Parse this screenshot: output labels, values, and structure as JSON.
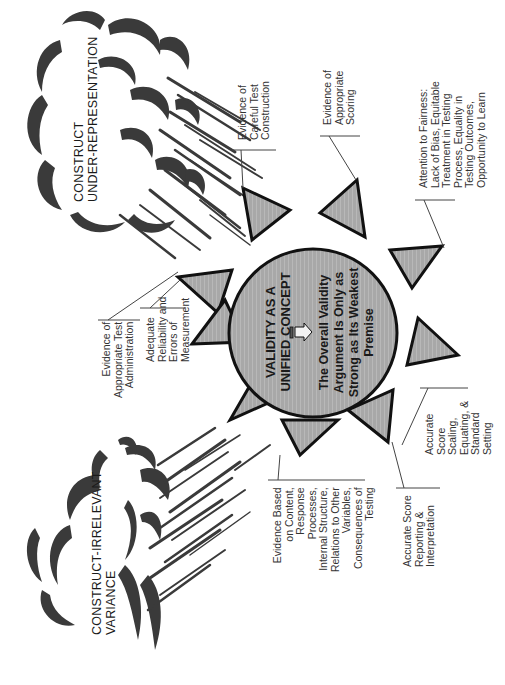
{
  "diagram": {
    "orientation": "rotated 90 degrees counter-clockwise",
    "center": {
      "title": "VALIDITY AS A\nUNIFIED CONCEPT",
      "arrow_icon": "right-arrow",
      "message": "The Overall Validity\nArgument Is Only as\nStrong as Its Weakest\nPremise"
    },
    "threats": [
      {
        "id": "construct-under-representation",
        "label": "CONSTRUCT\nUNDER-REPRESENTATION"
      },
      {
        "id": "construct-irrelevant-variance",
        "label": "CONSTRUCT-IRRELEVANT\nVARIANCE"
      }
    ],
    "premises": [
      {
        "id": "fairness",
        "label": "Attention to Fairness:\nLack of Bias, Equitable\nTreatment in Testing\nProcess, Equality in\nTesting Outcomes,\nOpportunity to Learn"
      },
      {
        "id": "scoring",
        "label": "Evidence of\nAppropriate\nScoring"
      },
      {
        "id": "test-construction",
        "label": "Evidence of\nCareful Test\nConstruction"
      },
      {
        "id": "reliability",
        "label": "Adequate\nReliability and\nErrors of\nMeasurement"
      },
      {
        "id": "test-administration",
        "label": "Evidence of\nAppropriate Test\nAdministration"
      },
      {
        "id": "content-evidence",
        "label": "Evidence Based\non Content,\nResponse\nProcesses,\nInternal Structure,\nRelations to Other\nVariables,\nConsequences of\nTesting"
      },
      {
        "id": "score-reporting",
        "label": "Accurate Score\nReporting &\nInterpretation"
      },
      {
        "id": "scaling",
        "label": "Accurate\nScore\nScaling,\nEquating, &\nStandard\nSetting"
      }
    ],
    "colors": {
      "sun_fill": "#a6a6a6",
      "outline": "#111111",
      "cloud_dark": "#3a3a3a",
      "text": "#333333"
    }
  }
}
